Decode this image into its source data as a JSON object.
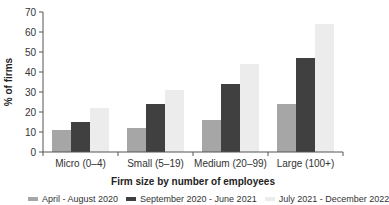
{
  "chart_data": {
    "type": "bar",
    "title": "",
    "xlabel": "Firm size by number of employees",
    "ylabel": "% of firms",
    "ylim": [
      0,
      70
    ],
    "yticks": [
      0,
      10,
      20,
      30,
      40,
      50,
      60,
      70
    ],
    "grid": false,
    "legend_position": "bottom",
    "categories": [
      "Micro (0–4)",
      "Small (5–19)",
      "Medium (20–99)",
      "Large (100+)"
    ],
    "series": [
      {
        "name": "April - August 2020",
        "color": "#a6a6a6",
        "values": [
          11,
          12,
          16,
          24
        ]
      },
      {
        "name": "September 2020 - June 2021",
        "color": "#404040",
        "values": [
          15,
          24,
          34,
          47
        ]
      },
      {
        "name": "July 2021 - December 2022",
        "color": "#ececec",
        "values": [
          22,
          31,
          44,
          64
        ]
      }
    ]
  }
}
